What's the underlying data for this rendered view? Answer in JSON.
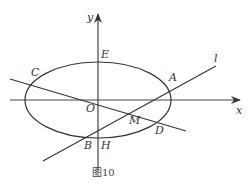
{
  "figure": {
    "caption": "图10",
    "labels": {
      "y_axis": "y",
      "x_axis": "x",
      "E": "E",
      "C": "C",
      "A": "A",
      "l": "l",
      "O": "O",
      "M": "M",
      "D": "D",
      "B": "B",
      "H": "H"
    }
  }
}
